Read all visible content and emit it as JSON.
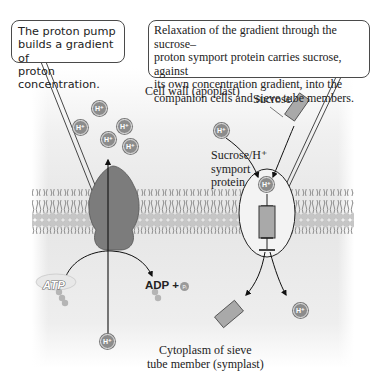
{
  "callouts": {
    "proton_pump": [
      "The proton pump",
      "builds a gradient of",
      "proton concentration."
    ],
    "symport": [
      "Relaxation of the gradient through the sucrose–",
      "proton symport protein carries sucrose, against",
      "its own concentration gradient, into the",
      "companion cells and sieve tube members."
    ]
  },
  "labels": {
    "cell_wall": "Cell wall (apoplast)",
    "sucrose": "Sucrose",
    "symport_protein": [
      "Sucrose/H⁺",
      "symport",
      "protein"
    ],
    "cytoplasm": [
      "Cytoplasm of sieve",
      "tube member (symplast)"
    ],
    "atp": "ATP",
    "adp": "ADP +",
    "pi": "Pᵢ"
  },
  "ions": {
    "proton": "H⁺"
  },
  "colors": {
    "membrane_head": "#c9c9c9",
    "membrane_tail": "#8a8a8a",
    "pump_fill": "#7c7c7c",
    "sucrose_fill": "#a9a9a9",
    "background_top": "#f2f2f2",
    "background_bottom": "#e3e3e3"
  }
}
